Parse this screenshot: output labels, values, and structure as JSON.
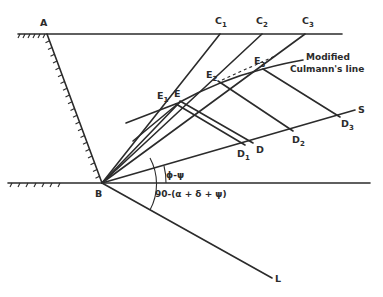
{
  "figure": {
    "points": {
      "A": "A",
      "B": "B",
      "C1": {
        "main": "C",
        "sub": "1"
      },
      "C2": {
        "main": "C",
        "sub": "2"
      },
      "C3": {
        "main": "C",
        "sub": "3"
      },
      "E": "E",
      "E1": {
        "main": "E",
        "sub": "1"
      },
      "E2": {
        "main": "E",
        "sub": "2"
      },
      "E3": {
        "main": "E",
        "sub": "3"
      },
      "D": "D",
      "D1": {
        "main": "D",
        "sub": "1"
      },
      "D2": {
        "main": "D",
        "sub": "2"
      },
      "D3": {
        "main": "D",
        "sub": "3"
      },
      "S": "S",
      "L": "L"
    },
    "annotations": {
      "culmann_line_1": "Modified",
      "culmann_line_2": "Culmann's line",
      "angle_phi_psi": "ϕ-ψ",
      "angle_lower": "90-(α + δ + ψ)"
    }
  }
}
